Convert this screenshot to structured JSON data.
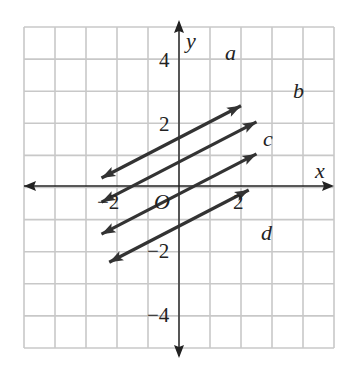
{
  "chart_data": {
    "type": "line",
    "title": "",
    "xlabel": "x",
    "ylabel": "y",
    "origin_label": "O",
    "xlim": [
      -5,
      5
    ],
    "ylim": [
      -5,
      5
    ],
    "grid": true,
    "x_ticks": [
      {
        "value": -2,
        "label": "−2"
      },
      {
        "value": 2,
        "label": "2"
      }
    ],
    "y_ticks": [
      {
        "value": 4,
        "label": "4"
      },
      {
        "value": 2,
        "label": "2"
      },
      {
        "value": -2,
        "label": "−2"
      },
      {
        "value": -4,
        "label": "−4"
      }
    ],
    "series": [
      {
        "name": "a",
        "slope": 0.5,
        "intercept": 3,
        "x": [
          -5,
          4
        ],
        "y": [
          0.5,
          5
        ]
      },
      {
        "name": "b",
        "slope": 0.5,
        "intercept": 1.5,
        "x": [
          -5,
          5
        ],
        "y": [
          -1,
          4
        ]
      },
      {
        "name": "c",
        "slope": 0.5,
        "intercept": -0.5,
        "x": [
          -5,
          5
        ],
        "y": [
          -3,
          2
        ]
      },
      {
        "name": "d",
        "slope": 0.5,
        "intercept": -2.5,
        "x": [
          -4.5,
          4.5
        ],
        "y": [
          -4.75,
          -0.25
        ]
      }
    ],
    "line_color": "#333333",
    "grid_color": "#c8c8c8"
  }
}
